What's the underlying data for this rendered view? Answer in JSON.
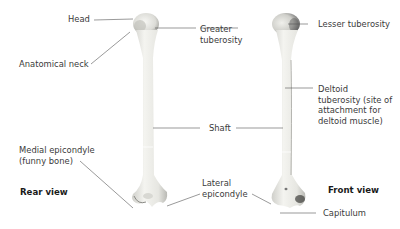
{
  "diagram": {
    "views": [
      {
        "label": "Rear view"
      },
      {
        "label": "Front view"
      }
    ],
    "labels": {
      "head": "Head",
      "anatomical_neck": "Anatomical neck",
      "greater_tuberosity": "Greater\ntuberosity",
      "lesser_tuberosity": "Lesser tuberosity",
      "deltoid_tuberosity": "Deltoid\ntuberosity (site of\nattachment for\ndeltoid muscle)",
      "shaft": "Shaft",
      "medial_epicondyle": "Medial epicondyle\n(funny bone)",
      "lateral_epicondyle": "Lateral\nepicondyle",
      "capitulum": "Capitulum"
    },
    "colors": {
      "bone_light": "#f2f2ee",
      "bone_shade": "#c9c9c4",
      "bone_dark": "#7d7d78",
      "leader_line": "#555555",
      "text": "#3a3a3a"
    }
  }
}
